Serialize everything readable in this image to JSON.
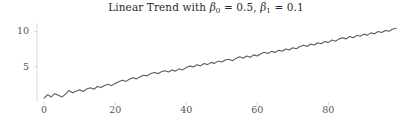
{
  "chart_data": {
    "type": "line",
    "title": "Linear Trend with β0 = 0.5, β1 = 0.1",
    "title_parts": {
      "prefix": "Linear Trend with ",
      "beta0_symbol": "β",
      "beta0_sub": "0",
      "beta0_eq": " = 0.5,",
      "beta1_symbol": "β",
      "beta1_sub": "1",
      "beta1_eq": " = 0.1"
    },
    "xlabel": "",
    "ylabel": "",
    "xlim": [
      -2.0,
      101.0
    ],
    "ylim": [
      0.0,
      11.2
    ],
    "xticks": [
      0,
      20,
      40,
      60,
      80
    ],
    "xtick_labels": [
      "0",
      "20",
      "40",
      "60",
      "80"
    ],
    "yticks": [
      5,
      10
    ],
    "ytick_labels": [
      "5",
      "10"
    ],
    "grid": false,
    "legend": null,
    "line_color": "#5c5c5c",
    "axis_color": "#d8d8d8",
    "tick_label_color": "#555555",
    "title_color": "#2a2a2a",
    "background_color": "#ffffff",
    "series": [
      {
        "name": "y = 0.5 + 0.1t + noise",
        "x": [
          0,
          1,
          2,
          3,
          4,
          5,
          6,
          7,
          8,
          9,
          10,
          11,
          12,
          13,
          14,
          15,
          16,
          17,
          18,
          19,
          20,
          21,
          22,
          23,
          24,
          25,
          26,
          27,
          28,
          29,
          30,
          31,
          32,
          33,
          34,
          35,
          36,
          37,
          38,
          39,
          40,
          41,
          42,
          43,
          44,
          45,
          46,
          47,
          48,
          49,
          50,
          51,
          52,
          53,
          54,
          55,
          56,
          57,
          58,
          59,
          60,
          61,
          62,
          63,
          64,
          65,
          66,
          67,
          68,
          69,
          70,
          71,
          72,
          73,
          74,
          75,
          76,
          77,
          78,
          79,
          80,
          81,
          82,
          83,
          84,
          85,
          86,
          87,
          88,
          89,
          90,
          91,
          92,
          93,
          94,
          95,
          96,
          97,
          98,
          99
        ],
        "y": [
          0.55,
          1.05,
          0.72,
          1.18,
          0.95,
          0.7,
          1.12,
          1.62,
          1.3,
          1.52,
          1.75,
          1.48,
          1.85,
          2.02,
          1.8,
          2.2,
          2.05,
          2.35,
          2.52,
          2.32,
          2.62,
          2.88,
          3.08,
          2.92,
          3.22,
          3.45,
          3.28,
          3.58,
          3.8,
          3.7,
          4.05,
          4.18,
          4.02,
          4.28,
          4.42,
          4.25,
          4.55,
          4.38,
          4.72,
          4.55,
          4.9,
          5.12,
          4.95,
          5.28,
          5.12,
          5.45,
          5.3,
          5.62,
          5.48,
          5.8,
          5.68,
          5.95,
          6.05,
          5.85,
          6.18,
          6.4,
          6.2,
          6.52,
          6.35,
          6.68,
          6.52,
          6.85,
          7.05,
          6.88,
          7.18,
          7.02,
          7.35,
          7.2,
          7.52,
          7.38,
          7.7,
          7.55,
          7.88,
          8.05,
          7.88,
          8.22,
          8.08,
          8.4,
          8.25,
          8.58,
          8.45,
          8.78,
          8.62,
          8.95,
          9.12,
          8.95,
          9.28,
          9.12,
          9.45,
          9.32,
          9.62,
          9.48,
          9.8,
          9.68,
          10.0,
          9.85,
          10.15,
          10.02,
          10.32,
          10.45
        ]
      }
    ]
  }
}
